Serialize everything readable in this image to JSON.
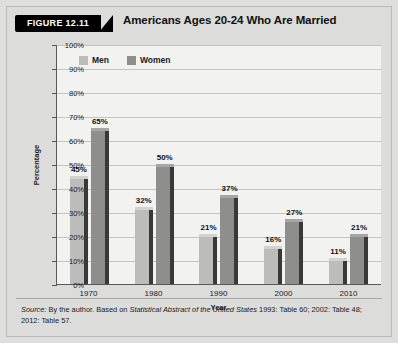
{
  "figure": {
    "tag": "FIGURE 12.11",
    "title": "Americans Ages 20-24 Who Are Married",
    "source_prefix": "Source:",
    "source_text_1": " By the author. Based on ",
    "source_italic": "Statistical Abstract of the United States",
    "source_text_2": " 1993: Table 60; 2002: Table 48; 2012: Table 57."
  },
  "chart_data": {
    "type": "bar",
    "title": "Americans Ages 20-24 Who Are Married",
    "xlabel": "Year",
    "ylabel": "Percentage",
    "categories": [
      "1970",
      "1980",
      "1990",
      "2000",
      "2010"
    ],
    "series": [
      {
        "name": "Men",
        "color": "#bcbcba",
        "values": [
          45,
          32,
          21,
          16,
          11
        ],
        "labels": [
          "45%",
          "32%",
          "21%",
          "16%",
          "11%"
        ]
      },
      {
        "name": "Women",
        "color": "#8e8e8c",
        "values": [
          65,
          50,
          37,
          27,
          21
        ],
        "labels": [
          "65%",
          "50%",
          "37%",
          "27%",
          "21%"
        ]
      }
    ],
    "ylim": [
      0,
      100
    ],
    "yticks": [
      100,
      90,
      80,
      70,
      60,
      50,
      40,
      30,
      20,
      10,
      0
    ],
    "ytick_labels": [
      "100%",
      "90%",
      "80%",
      "70%",
      "60%",
      "50%",
      "40%",
      "30%",
      "20%",
      "10%",
      "0%"
    ],
    "grid": true,
    "legend_position": "top-left-inside"
  }
}
